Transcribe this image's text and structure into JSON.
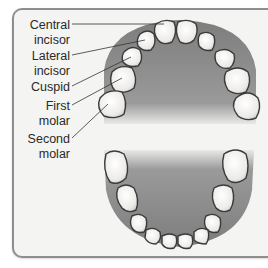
{
  "diagram": {
    "type": "dental-arch",
    "labels": [
      {
        "line1": "Central",
        "line2": "incisor",
        "target": "upper-central-incisor"
      },
      {
        "line1": "Lateral",
        "line2": "incisor",
        "target": "upper-lateral-incisor"
      },
      {
        "line1": "Cuspid",
        "line2": "",
        "target": "upper-cuspid"
      },
      {
        "line1": "First",
        "line2": "molar",
        "target": "upper-first-molar"
      },
      {
        "line1": "Second",
        "line2": "molar",
        "target": "upper-second-molar"
      }
    ],
    "colors": {
      "frame_bg": "#f4f4f3",
      "frame_border": "#8e8e8e",
      "palate": "#8f8f8f",
      "tooth_fill": "#f2f2f0",
      "tooth_outline": "#3a3a3a",
      "leader_line": "#333333"
    }
  }
}
